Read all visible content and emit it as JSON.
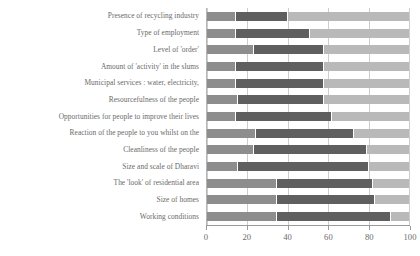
{
  "chart_data": {
    "type": "bar",
    "subtype": "stacked-horizontal-bar",
    "title": "",
    "xlabel": "",
    "ylabel": "",
    "xlim": [
      0,
      100
    ],
    "xticks": [
      0,
      20,
      40,
      60,
      80,
      100
    ],
    "grid": true,
    "legend": "none",
    "orientation": "horizontal",
    "stacked": true,
    "categories": [
      "Presence of recycling industry",
      "Type of employment",
      "Level of 'order'",
      "Amount of 'activity' in the slums",
      "Municipal services : water, electricity,",
      "Resourcefulness of the people",
      "Opportunities for people to improve their lives",
      "Reaction of the people to you whilst on the",
      "Cleanliness of the people",
      "Size and scale of Dharavi",
      "The 'look' of residential area",
      "Size of homes",
      "Working conditions"
    ],
    "series": [
      {
        "name": "segment-1",
        "color": "#8d8d8d",
        "values": [
          14,
          14,
          23,
          14,
          14,
          15,
          14,
          24,
          23,
          15,
          34,
          34,
          34
        ]
      },
      {
        "name": "segment-2",
        "color": "#5f5f5f",
        "values": [
          26,
          37,
          35,
          44,
          44,
          43,
          48,
          49,
          56,
          65,
          48,
          49,
          57
        ]
      },
      {
        "name": "segment-3",
        "color": "#b9b9b9",
        "values": [
          60,
          49,
          42,
          42,
          42,
          42,
          38,
          27,
          21,
          20,
          18,
          17,
          9
        ]
      }
    ],
    "cumulative_boundaries": [
      [
        14,
        40,
        100
      ],
      [
        14,
        51,
        100
      ],
      [
        23,
        58,
        100
      ],
      [
        14,
        58,
        100
      ],
      [
        14,
        58,
        100
      ],
      [
        15,
        58,
        100
      ],
      [
        14,
        62,
        100
      ],
      [
        24,
        73,
        100
      ],
      [
        23,
        79,
        100
      ],
      [
        15,
        80,
        100
      ],
      [
        34,
        82,
        100
      ],
      [
        34,
        83,
        100
      ],
      [
        34,
        91,
        100
      ]
    ]
  },
  "axis": {
    "x_tick_labels": [
      "0",
      "20",
      "40",
      "60",
      "80",
      "100"
    ]
  },
  "colors": {
    "segment_1": "#8d8d8d",
    "segment_2": "#5f5f5f",
    "segment_3": "#b9b9b9",
    "gridline": "#cdcdcd",
    "axis": "#9a9a9a",
    "text": "#6a6a6a",
    "background": "#ffffff"
  }
}
